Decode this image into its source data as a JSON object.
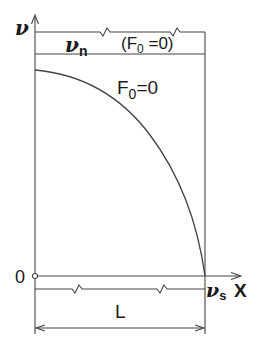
{
  "diagram": {
    "y_axis_label": "ν",
    "x_axis_label": "X",
    "origin_label": "0",
    "top_band_label_main": "ν",
    "top_band_label_sub": "n",
    "top_band_condition": "(F",
    "top_band_condition_sub": "0",
    "top_band_condition_tail": " =0)",
    "curve_label_main": "F",
    "curve_label_sub": "0",
    "curve_label_tail": "=0",
    "endpoint_label_main": "ν",
    "endpoint_label_sub": "s",
    "length_label": "L"
  },
  "colors": {
    "line": "#444444",
    "text": "#1a1a1a",
    "background": "#ffffff"
  }
}
